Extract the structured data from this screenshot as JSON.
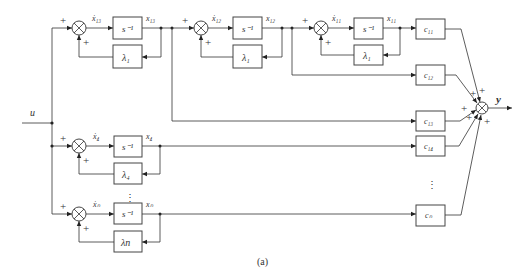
{
  "caption": "(a)",
  "input_label": "u",
  "output_label": "y",
  "plus_sign": "+",
  "integrator_label": "s⁻¹",
  "ellipsis": "⋮",
  "chain": {
    "stages": [
      {
        "input_label": "ẋ₁₃",
        "output_label": "x₁₃",
        "feedback_label": "λ₁"
      },
      {
        "input_label": "ẋ₁₂",
        "output_label": "x₁₂",
        "feedback_label": "λ₁"
      },
      {
        "input_label": "ẋ₁₁",
        "output_label": "x₁₁",
        "feedback_label": "λ₁"
      }
    ]
  },
  "single_modes": [
    {
      "input_label": "ẋ₄",
      "output_label": "x₄",
      "feedback_label": "λ₄"
    },
    {
      "input_label": "ẋₙ",
      "output_label": "xₙ",
      "feedback_label": "λn"
    }
  ],
  "gains": [
    {
      "label": "c₁₁"
    },
    {
      "label": "c₁₂"
    },
    {
      "label": "c₁₃"
    },
    {
      "label": "c₁₄"
    },
    {
      "label": "cₙ"
    }
  ]
}
